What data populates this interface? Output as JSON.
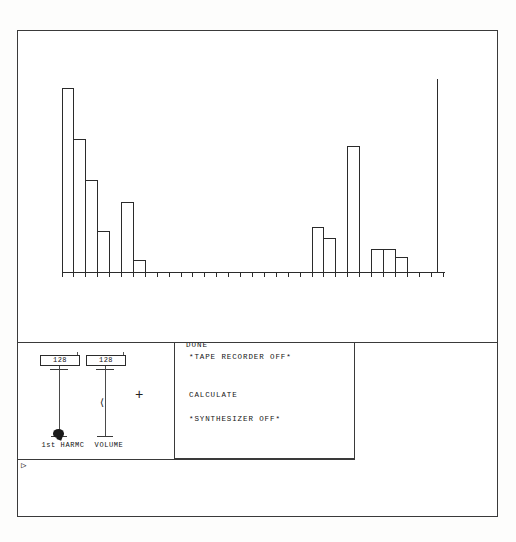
{
  "app": {
    "title": "Harmonic Spectrum Editor",
    "done_label": "DONE",
    "prompt_caret": "▷"
  },
  "sliders": [
    {
      "name": "1st-harmonic",
      "value": "128",
      "label": "1st HARMC",
      "x": 22,
      "handle_position": 0.97,
      "selected": true
    },
    {
      "name": "volume",
      "value": "128",
      "label": "VOLUME",
      "x": 68,
      "handle_position": 0.45,
      "selected": false
    }
  ],
  "pointer": {
    "crosshair_glyph": "+",
    "crosshair_x": 117,
    "crosshair_y": 45,
    "drag_arrow_glyph": "⟨"
  },
  "menu": {
    "items": [
      {
        "label": "*TAPE RECORDER  OFF*",
        "y": 10
      },
      {
        "label": "CALCULATE",
        "y": 48
      },
      {
        "label": "*SYNTHESIZER  OFF*",
        "y": 72
      }
    ]
  },
  "colors": {
    "ink": "#2b2b2b",
    "frame": "#3a3a3a",
    "paper": "#ffffff"
  },
  "chart_data": {
    "type": "bar",
    "title": "",
    "xlabel": "",
    "ylabel": "",
    "categories": [
      "1",
      "2",
      "3",
      "4",
      "5",
      "6",
      "7",
      "8",
      "9",
      "10",
      "11",
      "12",
      "13",
      "14",
      "15",
      "16",
      "17",
      "18",
      "19",
      "20",
      "21",
      "22",
      "23",
      "24",
      "25",
      "26",
      "27",
      "28",
      "29",
      "30",
      "31",
      "32"
    ],
    "values": [
      100,
      72,
      50,
      22,
      0,
      38,
      6,
      0,
      0,
      0,
      0,
      0,
      0,
      0,
      0,
      0,
      0,
      0,
      0,
      0,
      0,
      24,
      18,
      0,
      68,
      0,
      12,
      12,
      8,
      0,
      0,
      0
    ],
    "ylim": [
      0,
      100
    ],
    "xlim": [
      0,
      32
    ],
    "grid": false,
    "legend": null,
    "baseline_y": 272,
    "plot_left": 62,
    "plot_right": 443,
    "tick_count": 33,
    "cursor_line": {
      "x": 437,
      "value": 105,
      "label": ""
    }
  }
}
